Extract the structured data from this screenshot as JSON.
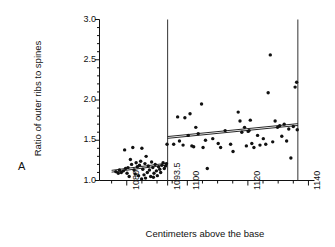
{
  "panel": {
    "label": "A"
  },
  "chart_data": {
    "type": "scatter",
    "title": "",
    "xlabel": "Centimeters above the base",
    "ylabel": "Ratio of outer ribs to spines",
    "xlim": [
      1071,
      1142
    ],
    "ylim": [
      1.0,
      3.0
    ],
    "grid": false,
    "legend": "none",
    "x_major_ticks": [
      1080,
      1093.5,
      1100,
      1120,
      1140
    ],
    "x_major_tick_labels": [
      "1080",
      "1093.5",
      "1100",
      "1120",
      "1140"
    ],
    "x_minor_tick_step": 5,
    "y_major_ticks": [
      1.0,
      1.5,
      2.0,
      2.5,
      3.0
    ],
    "y_major_tick_labels": [
      "1.0",
      "1.5",
      "2.0",
      "2.5",
      "3.0"
    ],
    "y_minor_tick_step": 0.1,
    "annotations": [
      {
        "name": "boundary-line-left",
        "type": "vline",
        "x": 1093.5
      },
      {
        "name": "boundary-line-right",
        "type": "vline",
        "x": 1136.5
      }
    ],
    "series": [
      {
        "name": "lower-segment-points",
        "marker": "filled-circle",
        "color": "#111111",
        "points": [
          [
            1076.4,
            1.11
          ],
          [
            1077.2,
            1.09
          ],
          [
            1077.6,
            1.13
          ],
          [
            1078.2,
            1.1
          ],
          [
            1078.9,
            1.12
          ],
          [
            1079.3,
            1.38
          ],
          [
            1079.6,
            1.15
          ],
          [
            1080.1,
            1.09
          ],
          [
            1080.4,
            1.16
          ],
          [
            1080.8,
            1.05
          ],
          [
            1081.2,
            1.26
          ],
          [
            1081.6,
            1.2
          ],
          [
            1082.0,
            1.41
          ],
          [
            1082.4,
            1.13
          ],
          [
            1082.8,
            1.08
          ],
          [
            1083.1,
            1.22
          ],
          [
            1083.5,
            1.17
          ],
          [
            1083.9,
            1.06
          ],
          [
            1084.2,
            1.19
          ],
          [
            1084.6,
            1.24
          ],
          [
            1085.0,
            1.4
          ],
          [
            1085.3,
            1.14
          ],
          [
            1085.7,
            1.07
          ],
          [
            1086.0,
            1.21
          ],
          [
            1086.4,
            1.3
          ],
          [
            1086.8,
            1.1
          ],
          [
            1087.1,
            1.18
          ],
          [
            1087.5,
            1.13
          ],
          [
            1087.9,
            1.05
          ],
          [
            1088.2,
            1.23
          ],
          [
            1088.6,
            1.16
          ],
          [
            1089.0,
            1.09
          ],
          [
            1089.4,
            1.2
          ],
          [
            1089.8,
            1.12
          ],
          [
            1090.1,
            1.06
          ],
          [
            1090.5,
            1.17
          ],
          [
            1090.9,
            1.14
          ],
          [
            1091.2,
            1.1
          ],
          [
            1091.6,
            1.19
          ],
          [
            1092.0,
            1.22
          ],
          [
            1092.4,
            1.15
          ],
          [
            1092.8,
            1.18
          ],
          [
            1093.1,
            1.21
          ],
          [
            1093.3,
            1.45
          ],
          [
            1084.9,
            1.02
          ],
          [
            1086.2,
            1.03
          ],
          [
            1088.8,
            1.04
          ]
        ]
      },
      {
        "name": "upper-segment-points",
        "marker": "filled-circle",
        "color": "#111111",
        "points": [
          [
            1095.5,
            1.45
          ],
          [
            1096.8,
            1.79
          ],
          [
            1097.4,
            1.49
          ],
          [
            1098.6,
            1.44
          ],
          [
            1099.2,
            1.78
          ],
          [
            1100.3,
            1.56
          ],
          [
            1100.9,
            1.83
          ],
          [
            1101.5,
            1.43
          ],
          [
            1102.1,
            1.42
          ],
          [
            1102.8,
            1.66
          ],
          [
            1103.6,
            1.58
          ],
          [
            1104.7,
            1.95
          ],
          [
            1105.2,
            1.41
          ],
          [
            1106.0,
            1.5
          ],
          [
            1106.6,
            1.15
          ],
          [
            1108.4,
            1.52
          ],
          [
            1110.2,
            1.46
          ],
          [
            1111.0,
            1.41
          ],
          [
            1112.5,
            1.62
          ],
          [
            1114.3,
            1.45
          ],
          [
            1115.1,
            1.36
          ],
          [
            1116.8,
            1.85
          ],
          [
            1117.4,
            1.74
          ],
          [
            1118.0,
            1.6
          ],
          [
            1118.9,
            1.66
          ],
          [
            1119.5,
            1.43
          ],
          [
            1120.1,
            1.61
          ],
          [
            1120.4,
            1.62
          ],
          [
            1120.8,
            1.75
          ],
          [
            1121.3,
            1.46
          ],
          [
            1122.0,
            1.41
          ],
          [
            1123.2,
            1.56
          ],
          [
            1124.0,
            1.44
          ],
          [
            1125.1,
            1.52
          ],
          [
            1125.9,
            1.45
          ],
          [
            1126.7,
            2.09
          ],
          [
            1127.4,
            2.56
          ],
          [
            1128.2,
            1.48
          ],
          [
            1129.0,
            1.74
          ],
          [
            1129.8,
            1.66
          ],
          [
            1130.5,
            1.68
          ],
          [
            1131.2,
            1.55
          ],
          [
            1132.0,
            1.7
          ],
          [
            1132.8,
            1.49
          ],
          [
            1133.5,
            1.64
          ],
          [
            1134.2,
            1.28
          ],
          [
            1135.0,
            1.67
          ],
          [
            1135.6,
            2.16
          ],
          [
            1136.1,
            2.22
          ],
          [
            1136.3,
            1.63
          ]
        ]
      }
    ],
    "fit_lines": [
      {
        "name": "lower-regression-line",
        "style": "solid-double",
        "color": "#111111",
        "x_start": 1075.0,
        "y_start": 1.115,
        "x_end": 1093.5,
        "y_end": 1.205
      },
      {
        "name": "upper-regression-line",
        "style": "solid-double",
        "color": "#111111",
        "x_start": 1093.5,
        "y_start": 1.535,
        "x_end": 1136.5,
        "y_end": 1.695
      }
    ]
  }
}
